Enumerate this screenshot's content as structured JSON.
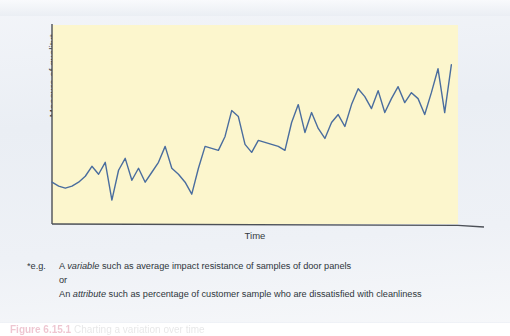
{
  "figure": {
    "y_axis_title": "Measure of quality*",
    "x_axis_title": "Time",
    "plot_background": "#fcf6cd",
    "line_color": "#4a6d9e",
    "axis_color": "#4c5057",
    "page_background": "#eef1f6"
  },
  "footnote": {
    "marker": "*e.g.",
    "line1_pre": "A ",
    "line1_italic": "variable",
    "line1_post": " such as average impact resistance of samples of door panels",
    "line2": "or",
    "line3_pre": "An ",
    "line3_italic": "attribute",
    "line3_post": " such as percentage of customer sample who are dissatisfied with cleanliness"
  },
  "caption": {
    "label": "Figure",
    "number": "6.15.1",
    "text": "Charting a variation over time"
  },
  "chart_data": {
    "type": "line",
    "title": "",
    "xlabel": "Time",
    "ylabel": "Measure of quality*",
    "grid": false,
    "legend": "none",
    "xlim": [
      0,
      61
    ],
    "ylim": [
      0,
      100
    ],
    "axis_ticks": "none",
    "series": [
      {
        "name": "Measure of quality",
        "x": [
          0,
          1,
          2,
          3,
          4,
          5,
          6,
          7,
          8,
          9,
          10,
          11,
          12,
          13,
          14,
          15,
          16,
          17,
          18,
          19,
          20,
          21,
          22,
          23,
          24,
          25,
          26,
          27,
          28,
          29,
          30,
          31,
          32,
          33,
          34,
          35,
          36,
          37,
          38,
          39,
          40,
          41,
          42,
          43,
          44,
          45,
          46,
          47,
          48,
          49,
          50,
          51,
          52,
          53,
          54,
          55,
          56,
          57,
          58,
          59,
          60
        ],
        "values": [
          21,
          19,
          18,
          19,
          21,
          24,
          29,
          25,
          31,
          12,
          27,
          33,
          22,
          28,
          21,
          26,
          31,
          39,
          28,
          25,
          21,
          15,
          28,
          39,
          38,
          37,
          44,
          57,
          54,
          40,
          36,
          42,
          41,
          40,
          39,
          37,
          51,
          60,
          46,
          56,
          48,
          43,
          51,
          55,
          49,
          60,
          68,
          64,
          58,
          67,
          56,
          63,
          69,
          61,
          66,
          63,
          55,
          66,
          78,
          56,
          80
        ]
      }
    ]
  }
}
